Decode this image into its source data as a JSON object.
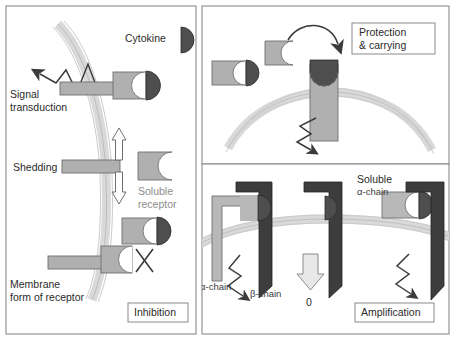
{
  "figure": {
    "panels": [
      {
        "id": "inhibition",
        "tag_label": "Inhibition",
        "labels": {
          "cytokine": "Cytokine",
          "signal_transduction_line1": "Signal",
          "signal_transduction_line2": "transduction",
          "shedding": "Shedding",
          "soluble_receptor_line1": "Soluble",
          "soluble_receptor_line2": "receptor",
          "membrane_form_line1": "Membrane",
          "membrane_form_line2": "form of receptor",
          "blocked_marker": "X"
        }
      },
      {
        "id": "protection-carrying",
        "tag_label_line1": "Protection",
        "tag_label_line2": "& carrying"
      },
      {
        "id": "amplification",
        "tag_label": "Amplification",
        "labels": {
          "alpha_chain": "α-chain",
          "beta_chain": "β-chain",
          "soluble_alpha_line1": "Soluble",
          "soluble_alpha_line2": "α-chain",
          "zero_signal": "0"
        }
      }
    ],
    "colors": {
      "receptor_light_gray": "#b0b0b0",
      "receptor_fill": "#adadad",
      "cytokine_dark": "#4e4e4e",
      "beta_chain_dark": "#3d3d3d",
      "membrane_gray": "#d6d6d6",
      "outline": "#4a4a4a",
      "panel_border": "#8a8a8a",
      "text": "#2b2b2b",
      "soluble_text": "#8d8d8d"
    },
    "caption": ""
  }
}
